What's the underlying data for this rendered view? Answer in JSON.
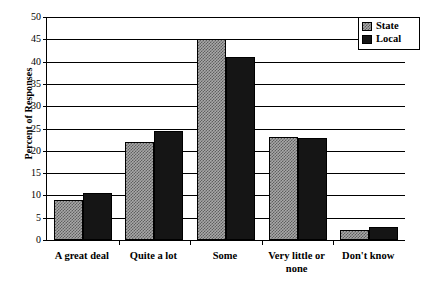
{
  "chart_data": {
    "type": "bar",
    "title": "",
    "xlabel": "",
    "ylabel": "Percent of Responses",
    "ylim": [
      0,
      50
    ],
    "yticks": [
      0,
      5,
      10,
      15,
      20,
      25,
      30,
      35,
      40,
      45,
      50
    ],
    "grid": true,
    "legend_position": "top-right",
    "categories": [
      "A great deal",
      "Quite a lot",
      "Some",
      "Very little or\nnone",
      "Don't know"
    ],
    "series": [
      {
        "name": "State",
        "values": [
          9,
          22,
          45,
          23,
          2.3
        ],
        "color": "#a8a8a8",
        "pattern": "checkerboard"
      },
      {
        "name": "Local",
        "values": [
          10.5,
          24.5,
          41,
          22.8,
          3
        ],
        "color": "#151515",
        "pattern": "solid"
      }
    ]
  },
  "axis": {
    "y_tick_labels": [
      "0",
      "5",
      "10",
      "15",
      "20",
      "25",
      "30",
      "35",
      "40",
      "45",
      "50"
    ],
    "y_title": "Percent of Responses"
  },
  "legend": {
    "items": [
      {
        "label": "State"
      },
      {
        "label": "Local"
      }
    ]
  }
}
